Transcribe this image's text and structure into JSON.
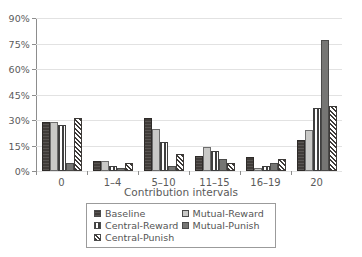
{
  "chart_data": {
    "type": "bar",
    "title": "",
    "xlabel": "Contribution intervals",
    "ylabel": "",
    "categories": [
      "0",
      "1–4",
      "5–10",
      "11–15",
      "16–19",
      "20"
    ],
    "series": [
      {
        "name": "Baseline",
        "values": [
          29,
          6,
          31,
          9,
          8,
          18
        ],
        "swatch": "solid-dark"
      },
      {
        "name": "Mutual-Reward",
        "values": [
          29,
          6,
          25,
          14,
          2,
          24
        ],
        "swatch": "light-gray"
      },
      {
        "name": "Central-Reward",
        "values": [
          27,
          3,
          17,
          12,
          3,
          37
        ],
        "swatch": "vertical-stripes"
      },
      {
        "name": "Mutual-Punish",
        "values": [
          5,
          2,
          3,
          7,
          5,
          77
        ],
        "swatch": "medium-gray"
      },
      {
        "name": "Central-Punish",
        "values": [
          31,
          5,
          10,
          5,
          7,
          38
        ],
        "swatch": "diagonal-crosshatch"
      }
    ],
    "ylim": [
      0,
      90
    ],
    "yticks": [
      0,
      15,
      30,
      45,
      60,
      75,
      90
    ],
    "ytick_labels": [
      "0%",
      "15%",
      "30%",
      "45%",
      "60%",
      "75%",
      "90%"
    ],
    "grid": true,
    "legend_position": "bottom",
    "colors": {
      "baseline": "#403c39",
      "mutual_reward": "#c9c9c7",
      "central_reward": "#3f3f3f",
      "mutual_punish": "#767674",
      "central_punish": "#3d3a38",
      "axis": "#8d8d8d",
      "gridline": "#e2e2e2",
      "text": "#5a5a5a"
    }
  },
  "legend": {
    "items": [
      {
        "label": "Baseline"
      },
      {
        "label": "Mutual-Reward"
      },
      {
        "label": "Central-Reward"
      },
      {
        "label": "Mutual-Punish"
      },
      {
        "label": "Central-Punish"
      }
    ]
  }
}
